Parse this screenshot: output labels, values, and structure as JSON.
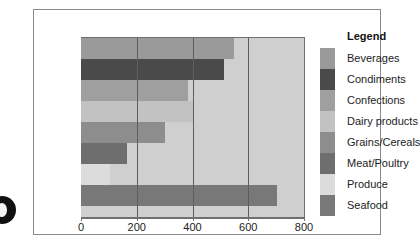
{
  "legend": {
    "title": "Legend"
  },
  "chart_data": {
    "type": "bar",
    "orientation": "horizontal",
    "title": "",
    "xlabel": "",
    "ylabel": "",
    "xlim": [
      0,
      800
    ],
    "xticks": [
      0,
      200,
      400,
      600,
      800
    ],
    "xtick_labels": [
      "0",
      "200",
      "400",
      "600",
      "800"
    ],
    "grid": true,
    "legend_position": "right",
    "plot_background": "#cfcfcf",
    "categories": [
      "Beverages",
      "Condiments",
      "Confections",
      "Dairy products",
      "Grains/Cereals",
      "Meat/Poultry",
      "Produce",
      "Seafood"
    ],
    "values": [
      548,
      512,
      385,
      400,
      300,
      165,
      105,
      703
    ],
    "colors": [
      "#9a9a9a",
      "#4a4a4a",
      "#9f9f9f",
      "#c2c2c2",
      "#8d8d8d",
      "#6e6e6e",
      "#dcdcdc",
      "#787878"
    ]
  }
}
